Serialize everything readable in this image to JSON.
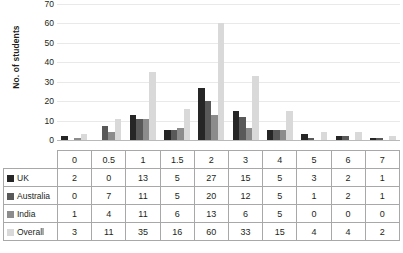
{
  "chart_data": {
    "type": "bar",
    "title": "",
    "xlabel": "",
    "ylabel": "No. of students",
    "ylim": [
      0,
      70
    ],
    "ytick_step": 10,
    "yticks": [
      70,
      60,
      50,
      40,
      30,
      20,
      10,
      0
    ],
    "grid": true,
    "legend_position": "table-row-labels",
    "categories": [
      "0",
      "0.5",
      "1",
      "1.5",
      "2",
      "3",
      "4",
      "5",
      "6",
      "7"
    ],
    "series": [
      {
        "name": "UK",
        "color": "#262626",
        "values": [
          2,
          0,
          13,
          5,
          27,
          15,
          5,
          3,
          2,
          1
        ]
      },
      {
        "name": "Australia",
        "color": "#595959",
        "values": [
          0,
          7,
          11,
          5,
          20,
          12,
          5,
          1,
          2,
          1
        ]
      },
      {
        "name": "India",
        "color": "#8c8c8c",
        "values": [
          1,
          4,
          11,
          6,
          13,
          6,
          5,
          0,
          0,
          0
        ]
      },
      {
        "name": "Overall",
        "color": "#d9d9d9",
        "values": [
          3,
          11,
          35,
          16,
          60,
          33,
          15,
          4,
          4,
          2
        ]
      }
    ]
  },
  "table": {
    "header_label": "",
    "columns": [
      "0",
      "0.5",
      "1",
      "1.5",
      "2",
      "3",
      "4",
      "5",
      "6",
      "7"
    ],
    "rows": [
      {
        "label": "UK",
        "swatch": "#262626",
        "values": [
          "2",
          "0",
          "13",
          "5",
          "27",
          "15",
          "5",
          "3",
          "2",
          "1"
        ]
      },
      {
        "label": "Australia",
        "swatch": "#595959",
        "values": [
          "0",
          "7",
          "11",
          "5",
          "20",
          "12",
          "5",
          "1",
          "2",
          "1"
        ]
      },
      {
        "label": "India",
        "swatch": "#8c8c8c",
        "values": [
          "1",
          "4",
          "11",
          "6",
          "13",
          "6",
          "5",
          "0",
          "0",
          "0"
        ]
      },
      {
        "label": "Overall",
        "swatch": "#d9d9d9",
        "values": [
          "3",
          "11",
          "35",
          "16",
          "60",
          "33",
          "15",
          "4",
          "4",
          "2"
        ]
      }
    ]
  }
}
